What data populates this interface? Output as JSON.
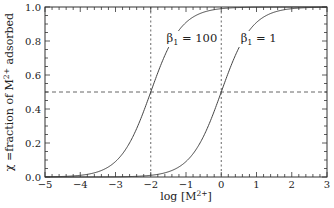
{
  "chart_data": {
    "type": "line",
    "title": "",
    "xlabel": "log [M2+]",
    "xlabel_parts": {
      "prefix": "log [M",
      "sup": "2+",
      "suffix": "]"
    },
    "ylabel": "χ = fraction of M2+ adsorbed",
    "ylabel_parts": {
      "prefix": "χ =fraction of M",
      "sup": "2+",
      "suffix": " adsorbed"
    },
    "xlim": [
      -5,
      3
    ],
    "ylim": [
      0.0,
      1.0
    ],
    "x_ticks": [
      -5,
      -4,
      -3,
      -2,
      -1,
      0,
      1,
      2,
      3
    ],
    "x_tick_labels": [
      "−5",
      "−4",
      "−3",
      "−2",
      "−1",
      "0",
      "1",
      "2",
      "3"
    ],
    "y_ticks": [
      0.0,
      0.2,
      0.4,
      0.6,
      0.8,
      1.0
    ],
    "y_tick_labels": [
      "0.0",
      "0.2",
      "0.4",
      "0.6",
      "0.8",
      "1.0"
    ],
    "grid": false,
    "legend": "inline labels",
    "series": [
      {
        "name": "β1 = 100",
        "label_main": "β",
        "label_sub": "1",
        "label_rest": " = 100",
        "beta": 100,
        "midpoint_log": -2,
        "x": [
          -5,
          -4.5,
          -4,
          -3.5,
          -3,
          -2.5,
          -2,
          -1.5,
          -1,
          -0.5,
          0,
          0.5,
          1,
          2,
          3
        ],
        "values": [
          0.001,
          0.003,
          0.01,
          0.031,
          0.091,
          0.24,
          0.5,
          0.76,
          0.909,
          0.969,
          0.99,
          0.997,
          0.999,
          1.0,
          1.0
        ]
      },
      {
        "name": "β1 = 1",
        "label_main": "β",
        "label_sub": "1",
        "label_rest": " = 1",
        "beta": 1,
        "midpoint_log": 0,
        "x": [
          -3,
          -2.5,
          -2,
          -1.5,
          -1,
          -0.5,
          0,
          0.5,
          1,
          1.5,
          2,
          2.5,
          3
        ],
        "values": [
          0.001,
          0.003,
          0.01,
          0.031,
          0.091,
          0.24,
          0.5,
          0.76,
          0.909,
          0.969,
          0.99,
          0.997,
          0.999
        ]
      }
    ],
    "reference_lines": {
      "horizontal_dashed_y": 0.5,
      "vertical_dotted_x": [
        -2,
        0
      ]
    }
  },
  "colors": {
    "axis": "#333333",
    "curve": "#444444",
    "dashed": "#555555"
  }
}
